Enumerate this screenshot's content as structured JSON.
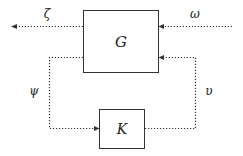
{
  "diagram": {
    "type": "feedback-block-diagram",
    "blocks": [
      {
        "id": "G",
        "label": "G"
      },
      {
        "id": "K",
        "label": "K"
      }
    ],
    "signals": [
      {
        "id": "zeta",
        "label": "ζ",
        "from": "G",
        "to": "output"
      },
      {
        "id": "omega",
        "label": "ω",
        "from": "input",
        "to": "G"
      },
      {
        "id": "psi",
        "label": "ψ",
        "from": "G",
        "to": "K"
      },
      {
        "id": "upsilon",
        "label": "υ",
        "from": "K",
        "to": "G"
      }
    ],
    "colors": {
      "line": "#222222",
      "background": "#ffffff"
    }
  }
}
